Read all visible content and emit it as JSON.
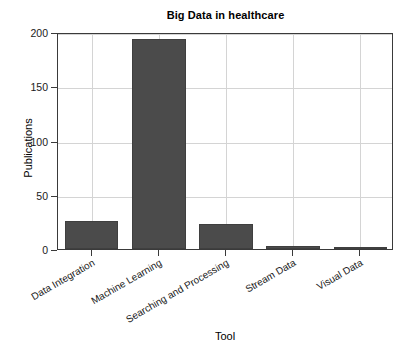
{
  "chart_data": {
    "type": "bar",
    "title": "Big Data in healthcare",
    "xlabel": "Tool",
    "ylabel": "Publications",
    "categories": [
      "Data Integration",
      "Machine Learning",
      "Searching and Processing",
      "Stream Data",
      "Visual Data"
    ],
    "values": [
      26,
      194,
      23,
      3,
      2
    ],
    "series": [
      {
        "name": "Publications",
        "values": [
          26,
          194,
          23,
          3,
          2
        ]
      }
    ],
    "ylim": [
      0,
      200
    ],
    "yticks": [
      0,
      50,
      100,
      150,
      200
    ],
    "ytick_labels": [
      "0",
      "50",
      "100",
      "150",
      "200"
    ],
    "xtick_rotation_deg": -30,
    "grid": true,
    "grid_axis": "both",
    "legend": false,
    "legend_position": "none",
    "bar_color": "#4b4b4b",
    "bar_edge_color": "#3f3f3f",
    "grid_color": "#d4d4d4",
    "axis_color": "#3a3a3a",
    "background_color": "#ffffff",
    "bar_width_fraction": 0.8
  }
}
